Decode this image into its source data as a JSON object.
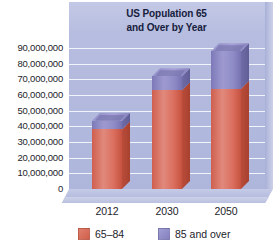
{
  "chart_data": {
    "type": "bar",
    "subtype": "stacked-column-3d",
    "title": "US Population 65 and Over by Year",
    "title_line1": "US Population 65",
    "title_line2": "and Over by Year",
    "xlabel": "",
    "ylabel": "",
    "categories": [
      "2012",
      "2030",
      "2050"
    ],
    "series": [
      {
        "name": "65–84",
        "color": "#d0604c",
        "values": [
          38000000,
          63000000,
          64000000
        ]
      },
      {
        "name": "85 and over",
        "color": "#8d88c4",
        "values": [
          5500000,
          9000000,
          24000000
        ]
      }
    ],
    "totals": [
      43500000,
      72000000,
      88000000
    ],
    "ylim": [
      0,
      90000000
    ],
    "ytick_step": 10000000,
    "ytick_labels": [
      "90,000,000",
      "80,000,000",
      "70,000,000",
      "60,000,000",
      "50,000,000",
      "40,000,000",
      "30,000,000",
      "20,000,000",
      "10,000,000",
      "0"
    ],
    "grid": true,
    "legend_position": "bottom",
    "plot_background": "#b3bade",
    "gridline_color": "#f2f4fb",
    "text_color": "#1d1d2b",
    "title_color": "#16203d"
  },
  "legend": {
    "items": [
      {
        "label": "65–84",
        "swatch": "lower-series-swatch"
      },
      {
        "label": "85 and over",
        "swatch": "upper-series-swatch"
      }
    ]
  }
}
